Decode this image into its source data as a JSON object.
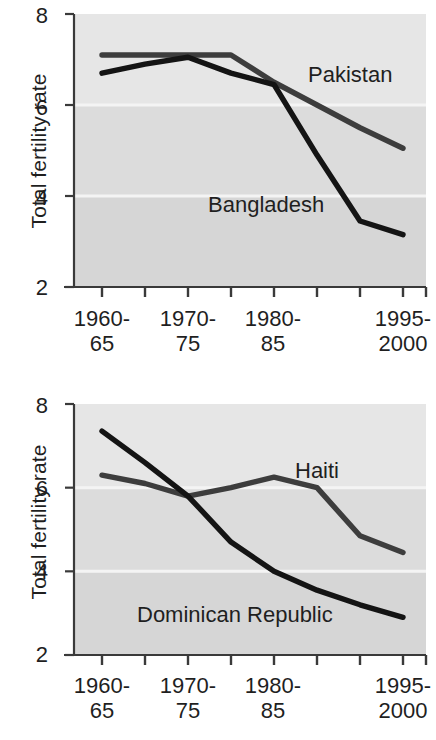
{
  "figure": {
    "background_color": "#ffffff",
    "plot_background_color": "#e6e6e6",
    "plot_background_lower_color": "#dcdcdc",
    "gridline_color": "#f4f4f4",
    "axis_color": "#3a3a3a"
  },
  "charts": [
    {
      "id": "chart-pakistan-bangladesh",
      "ylabel": "Total fertility rate",
      "ytick_labels": [
        "8",
        "6",
        "4",
        "2"
      ],
      "xtick_labels": [
        {
          "line1": "1960-",
          "line2": "65"
        },
        {
          "line1": "1970-",
          "line2": "75"
        },
        {
          "line1": "1980-",
          "line2": "85"
        },
        {
          "line1": "1995-",
          "line2": "2000"
        }
      ],
      "series_labels": [
        "Pakistan",
        "Bangladesh"
      ],
      "chart_data": {
        "type": "line",
        "title": "",
        "xlabel": "",
        "ylabel": "Total fertility rate",
        "ylim": [
          2,
          8
        ],
        "yticks": [
          2,
          4,
          6,
          8
        ],
        "grid": "horizontal-white-lines-at-4-and-6",
        "legend": "inline-labels",
        "x": [
          "1960-65",
          "1965-70",
          "1970-75",
          "1975-80",
          "1980-85",
          "1985-90",
          "1990-95",
          "1995-2000"
        ],
        "xtick_labeled": [
          "1960-65",
          "1970-75",
          "1980-85",
          "1995-2000"
        ],
        "series": [
          {
            "name": "Pakistan",
            "color": "#3d3d3d",
            "values": [
              7.1,
              7.1,
              7.1,
              7.1,
              6.5,
              6.0,
              5.5,
              5.05
            ]
          },
          {
            "name": "Bangladesh",
            "color": "#141414",
            "values": [
              6.7,
              6.9,
              7.05,
              6.7,
              6.45,
              4.9,
              3.45,
              3.15
            ]
          }
        ]
      }
    },
    {
      "id": "chart-haiti-dominican-republic",
      "ylabel": "Total fertility rate",
      "ytick_labels": [
        "8",
        "6",
        "4",
        "2"
      ],
      "xtick_labels": [
        {
          "line1": "1960-",
          "line2": "65"
        },
        {
          "line1": "1970-",
          "line2": "75"
        },
        {
          "line1": "1980-",
          "line2": "85"
        },
        {
          "line1": "1995-",
          "line2": "2000"
        }
      ],
      "series_labels": [
        "Haiti",
        "Dominican Republic"
      ],
      "chart_data": {
        "type": "line",
        "title": "",
        "xlabel": "",
        "ylabel": "Total fertility rate",
        "ylim": [
          2,
          8
        ],
        "yticks": [
          2,
          4,
          6,
          8
        ],
        "grid": "horizontal-white-lines-at-4-and-6",
        "legend": "inline-labels",
        "x": [
          "1960-65",
          "1965-70",
          "1970-75",
          "1975-80",
          "1980-85",
          "1985-90",
          "1990-95",
          "1995-2000"
        ],
        "xtick_labeled": [
          "1960-65",
          "1970-75",
          "1980-85",
          "1995-2000"
        ],
        "series": [
          {
            "name": "Haiti",
            "color": "#3d3d3d",
            "values": [
              6.3,
              6.1,
              5.8,
              6.0,
              6.25,
              6.0,
              4.85,
              4.45
            ]
          },
          {
            "name": "Dominican Republic",
            "color": "#141414",
            "values": [
              7.35,
              6.6,
              5.8,
              4.7,
              4.0,
              3.55,
              3.2,
              2.9
            ]
          }
        ]
      }
    }
  ]
}
